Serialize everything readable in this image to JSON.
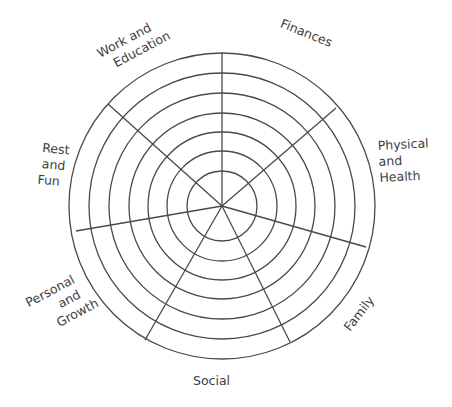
{
  "diagram": {
    "type": "polar-segmented-wheel",
    "center": {
      "x": 222,
      "y": 206
    },
    "ring_radii": [
      35,
      55,
      74,
      93,
      113,
      133,
      153
    ],
    "ring_count": 7,
    "line_color": "#4a4a4a",
    "text_color": "#3e3e3e",
    "spokes": [
      {
        "x": 222,
        "y": 53
      },
      {
        "x": 336,
        "y": 108
      },
      {
        "x": 366,
        "y": 247
      },
      {
        "x": 290,
        "y": 342
      },
      {
        "x": 145,
        "y": 340
      },
      {
        "x": 76,
        "y": 231
      },
      {
        "x": 108,
        "y": 104
      }
    ],
    "segments": [
      {
        "label_lines": [
          "Finances"
        ]
      },
      {
        "label_lines": [
          "Physical",
          "and",
          "Health"
        ]
      },
      {
        "label_lines": [
          "Family"
        ]
      },
      {
        "label_lines": [
          "Social"
        ]
      },
      {
        "label_lines": [
          "Personal",
          "and",
          "Growth"
        ]
      },
      {
        "label_lines": [
          "Rest",
          "and",
          "Fun"
        ]
      },
      {
        "label_lines": [
          "Work and",
          "Education"
        ]
      }
    ]
  }
}
